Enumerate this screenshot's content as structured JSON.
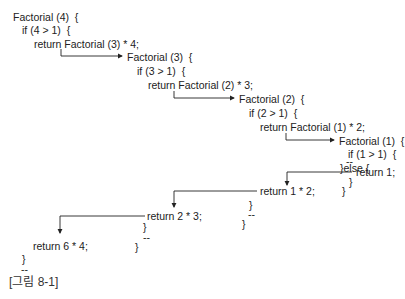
{
  "caption": "[그림 8-1]",
  "colors": {
    "text": "#222222",
    "line": "#222222",
    "background": "#ffffff"
  },
  "call_chain": {
    "f4": {
      "header": "Factorial (4)  {",
      "cond": "if (4 > 1)  {",
      "ret_call": "return Factorial (3) * 4;",
      "ret_value": "return 6 * 4;",
      "close_if": "}",
      "ellipsis": "--"
    },
    "f3": {
      "header": "Factorial (3)  {",
      "cond": "if (3 > 1)  {",
      "ret_call": "return Factorial (2) * 3;",
      "ret_value": "return 2 * 3;",
      "close_if": "}",
      "ellipsis": "--",
      "close_fn": "}"
    },
    "f2": {
      "header": "Factorial (2)  {",
      "cond": "if (2 > 1)  {",
      "ret_call": "return Factorial (1) * 2;",
      "ret_value": "return 1 * 2;",
      "close_if": "}",
      "ellipsis": "--",
      "close_fn": "}"
    },
    "f1": {
      "header": "Factorial (1)  {",
      "cond": "if (1 > 1)  {",
      "ellipsis": "--",
      "else": "}else {",
      "ret_base": "return 1;",
      "close_else": "}",
      "close_fn": "}"
    }
  },
  "arrows": [
    {
      "name": "call-f3-arrow",
      "from": "f4.ret_call",
      "to": "f3.header",
      "direction": "right"
    },
    {
      "name": "call-f2-arrow",
      "from": "f3.ret_call",
      "to": "f2.header",
      "direction": "right"
    },
    {
      "name": "call-f1-arrow",
      "from": "f2.ret_call",
      "to": "f1.header",
      "direction": "right"
    },
    {
      "name": "return-1-arrow",
      "from": "f1.ret_base",
      "to": "f2.ret_value",
      "direction": "down"
    },
    {
      "name": "return-2-arrow",
      "from": "f2.ret_value",
      "to": "f3.ret_value",
      "direction": "down"
    },
    {
      "name": "return-6-arrow",
      "from": "f3.ret_value",
      "to": "f4.ret_value",
      "direction": "down"
    }
  ]
}
